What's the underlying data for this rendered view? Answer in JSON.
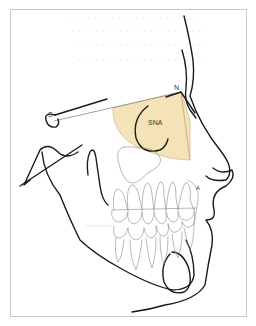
{
  "figure": {
    "labels": {
      "sella": "S",
      "nasion": "N",
      "a_point": "A",
      "angle": "SNA"
    },
    "colors": {
      "angle_fill": "#f5e3b8",
      "angle_stroke": "#c9b27a",
      "line": "#1a1a1a",
      "teeth": "#8a8a8a",
      "frame": "#c8c8c8"
    }
  },
  "caption": ""
}
